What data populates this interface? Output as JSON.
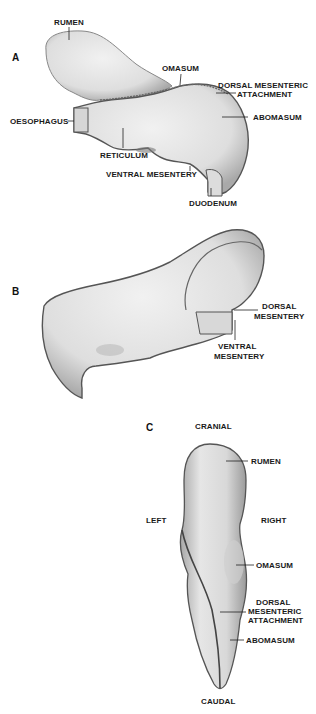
{
  "panels": {
    "a": {
      "letter": "A",
      "labels": {
        "rumen": "RUMEN",
        "omasum": "OMASUM",
        "dorsal_mesenteric_1": "DORSAL MESENTERIC",
        "dorsal_mesenteric_2": "ATTACHMENT",
        "oesophagus": "OESOPHAGUS",
        "abomasum": "ABOMASUM",
        "reticulum": "RETICULUM",
        "ventral_mesentery": "VENTRAL MESENTERY",
        "duodenum": "DUODENUM"
      }
    },
    "b": {
      "letter": "B",
      "labels": {
        "dorsal_1": "DORSAL",
        "dorsal_2": "MESENTERY",
        "ventral_1": "VENTRAL",
        "ventral_2": "MESENTERY"
      }
    },
    "c": {
      "letter": "C",
      "labels": {
        "cranial": "CRANIAL",
        "rumen": "RUMEN",
        "left": "LEFT",
        "right": "RIGHT",
        "omasum": "OMASUM",
        "dorsal_1": "DORSAL",
        "dorsal_2": "MESENTERIC",
        "dorsal_3": "ATTACHMENT",
        "abomasum": "ABOMASUM",
        "caudal": "CAUDAL"
      }
    }
  },
  "colors": {
    "organ_fill": "#e4e4e4",
    "organ_shadow": "#b9b9b9",
    "outline": "#555555",
    "text": "#1a1a1a"
  }
}
